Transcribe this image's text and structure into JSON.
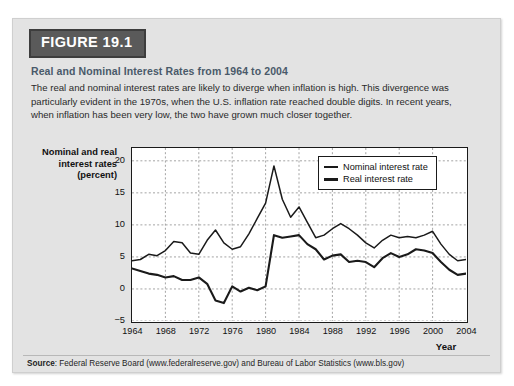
{
  "figure": {
    "badge_label": "FIGURE 19.1",
    "subtitle": "Real and Nominal Interest Rates from 1964 to 2004",
    "description": "The real and nominal interest rates are likely to diverge when inflation is high. This divergence was particularly evident in the 1970s, when the U.S. inflation rate reached double digits. In recent years, when inflation has been very low, the two have grown much closer together.",
    "source_prefix": "Source",
    "source_text": ": Federal Reserve Board (www.federalreserve.gov) and Bureau of Labor Statistics (www.bls.gov)"
  },
  "colors": {
    "card_background": "#e3e3e3",
    "badge_background": "#5a5a5a",
    "badge_text": "#ffffff",
    "subtitle_text": "#4a5a6a",
    "line_color": "#1a1a1a",
    "grid_color": "#9a9a9a",
    "plot_background": "#ffffff"
  },
  "chart_data": {
    "type": "line",
    "title": "Real and Nominal Interest Rates from 1964 to 2004",
    "xlabel": "Year",
    "ylabel": "Nominal and real interest rates (percent)",
    "xlim": [
      1964,
      2004
    ],
    "ylim": [
      -5,
      22
    ],
    "yticks": [
      20,
      15,
      10,
      5,
      0,
      -5
    ],
    "xticks": [
      1964,
      1968,
      1972,
      1976,
      1980,
      1984,
      1988,
      1992,
      1996,
      2000,
      2004
    ],
    "grid": true,
    "legend_position": "top-right",
    "x": [
      1964,
      1965,
      1966,
      1967,
      1968,
      1969,
      1970,
      1971,
      1972,
      1973,
      1974,
      1975,
      1976,
      1977,
      1978,
      1979,
      1980,
      1981,
      1982,
      1983,
      1984,
      1985,
      1986,
      1987,
      1988,
      1989,
      1990,
      1991,
      1992,
      1993,
      1994,
      1995,
      1996,
      1997,
      1998,
      1999,
      2000,
      2001,
      2002,
      2003,
      2004
    ],
    "series": [
      {
        "name": "Nominal interest rate",
        "values": [
          4.4,
          4.6,
          5.4,
          5.2,
          6.0,
          7.4,
          7.2,
          5.6,
          5.4,
          7.6,
          9.2,
          7.2,
          6.2,
          6.6,
          8.6,
          11.0,
          13.4,
          19.2,
          14.0,
          11.2,
          12.8,
          10.4,
          8.0,
          8.4,
          9.4,
          10.2,
          9.4,
          8.4,
          7.2,
          6.4,
          7.6,
          8.4,
          8.0,
          8.2,
          8.0,
          8.4,
          9.0,
          7.0,
          5.4,
          4.4,
          4.6
        ],
        "style": "thin"
      },
      {
        "name": "Real interest rate",
        "values": [
          3.2,
          2.8,
          2.4,
          2.2,
          1.8,
          2.0,
          1.4,
          1.4,
          1.8,
          0.8,
          -1.8,
          -2.2,
          0.4,
          -0.4,
          0.2,
          -0.2,
          0.4,
          8.4,
          8.0,
          8.2,
          8.4,
          7.0,
          6.2,
          4.6,
          5.2,
          5.4,
          4.2,
          4.4,
          4.2,
          3.4,
          4.8,
          5.6,
          5.0,
          5.4,
          6.2,
          6.0,
          5.6,
          4.2,
          3.0,
          2.2,
          2.4
        ],
        "style": "thick"
      }
    ]
  }
}
